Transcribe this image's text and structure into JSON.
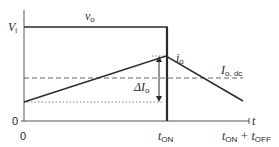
{
  "diagram": {
    "type": "waveform",
    "axes": {
      "y_labels": {
        "vi": "V",
        "vi_sub": "i",
        "zero": "0"
      },
      "x_labels": {
        "zero": "0",
        "t_on": "t",
        "t_on_sub": "ON",
        "t_on_plus": "t",
        "t_on_plus_sub": "ON",
        "plus": " + t",
        "t_off_sub": "OFF",
        "axis": "t"
      }
    },
    "signals": {
      "vo": {
        "label": "v",
        "sub": "o"
      },
      "io": {
        "label": "i",
        "sub": "o"
      },
      "io_dc": {
        "label": "I",
        "sub": "o, dc"
      },
      "delta_io": {
        "label": "ΔI",
        "sub": "o"
      }
    },
    "colors": {
      "line": "#2a2a2a",
      "dashed": "#555555",
      "background": "#ffffff"
    }
  }
}
